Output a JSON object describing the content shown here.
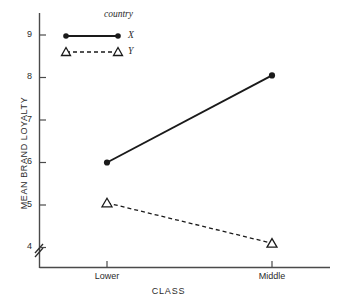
{
  "chart_data": {
    "type": "line",
    "title": "",
    "xlabel": "CLASS",
    "ylabel": "MEAN BRAND LOYALTY",
    "categories": [
      "Lower",
      "Middle"
    ],
    "ylim": [
      3.6,
      9.4
    ],
    "yticks": [
      4,
      5,
      6,
      7,
      8,
      9
    ],
    "ytick_labels": [
      "4",
      "5",
      "6",
      "7",
      "8",
      "9"
    ],
    "xtick_labels": [
      "Lower",
      "Middle"
    ],
    "grid": false,
    "y_axis_break": true,
    "legend": {
      "title": "country",
      "position": "top-center",
      "entries": [
        {
          "name": "X",
          "marker": "filled-circle",
          "line": "solid"
        },
        {
          "name": "Y",
          "marker": "open-triangle",
          "line": "dashed"
        }
      ]
    },
    "series": [
      {
        "name": "X",
        "values": [
          6.0,
          8.05
        ],
        "marker": "filled-circle",
        "line": "solid",
        "color": "#1a1a1a"
      },
      {
        "name": "Y",
        "values": [
          5.05,
          4.1
        ],
        "marker": "open-triangle",
        "line": "dashed",
        "color": "#1a1a1a"
      }
    ]
  },
  "axis": {
    "y_title": "MEAN BRAND LOYALTY",
    "x_title": "CLASS",
    "y_labels": [
      "9",
      "8",
      "7",
      "6",
      "5",
      "4"
    ],
    "x_labels": [
      "Lower",
      "Middle"
    ]
  },
  "legend": {
    "title": "country",
    "label_x": "X",
    "label_y": "Y"
  },
  "colors": {
    "ink": "#1a1a1a",
    "axis": "#4a4a4a",
    "background": "#ffffff"
  }
}
